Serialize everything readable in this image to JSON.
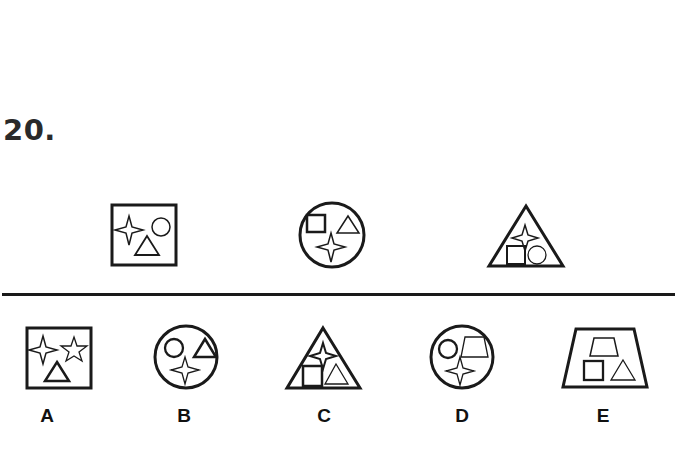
{
  "question": {
    "number": "20."
  },
  "examples": [
    {
      "outer": "square",
      "inner": [
        "four-point-star",
        "circle",
        "triangle"
      ]
    },
    {
      "outer": "circle",
      "inner": [
        "square",
        "triangle",
        "four-point-star"
      ]
    },
    {
      "outer": "triangle",
      "inner": [
        "four-point-star",
        "square",
        "circle"
      ]
    }
  ],
  "options": [
    {
      "label": "A",
      "outer": "square",
      "inner": [
        "four-point-star",
        "five-point-star",
        "triangle"
      ]
    },
    {
      "label": "B",
      "outer": "circle",
      "inner": [
        "circle",
        "triangle",
        "four-point-star"
      ]
    },
    {
      "label": "C",
      "outer": "triangle",
      "inner": [
        "four-point-star",
        "square",
        "triangle"
      ]
    },
    {
      "label": "D",
      "outer": "circle",
      "inner": [
        "circle",
        "trapezoid",
        "four-point-star"
      ]
    },
    {
      "label": "E",
      "outer": "trapezoid",
      "inner": [
        "trapezoid",
        "square",
        "triangle"
      ]
    }
  ],
  "colors": {
    "stroke": "#1a1a1a",
    "background": "#ffffff"
  }
}
